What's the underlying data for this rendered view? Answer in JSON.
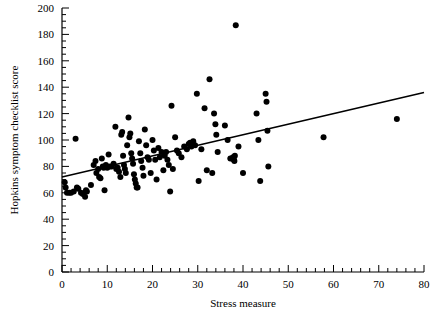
{
  "chart_data": {
    "type": "scatter",
    "title": "",
    "xlabel": "Stress measure",
    "ylabel": "Hopkins symptom checklist score",
    "xlim": [
      0,
      80
    ],
    "ylim": [
      0,
      200
    ],
    "xticks": [
      0,
      10,
      20,
      30,
      40,
      50,
      60,
      70,
      80
    ],
    "yticks": [
      0,
      20,
      40,
      60,
      80,
      100,
      120,
      140,
      160,
      180,
      200
    ],
    "xticklabels": [
      "0",
      "10",
      "20",
      "30",
      "40",
      "50",
      "60",
      "70",
      "80"
    ],
    "yticklabels": [
      "0",
      "20",
      "40",
      "60",
      "80",
      "100",
      "120",
      "140",
      "160",
      "180",
      "200"
    ],
    "x_minor_tick_step": 2,
    "y_minor_tick_step": 5,
    "grid": false,
    "legend": null,
    "marker": "filled-circle",
    "marker_color": "#000000",
    "marker_size_px": 4.2,
    "series": [
      {
        "name": "observations",
        "points": [
          [
            0.6,
            68
          ],
          [
            0.8,
            64
          ],
          [
            1.1,
            60
          ],
          [
            1.6,
            60
          ],
          [
            2.0,
            60
          ],
          [
            2.6,
            61
          ],
          [
            3.0,
            101
          ],
          [
            3.3,
            64
          ],
          [
            3.6,
            63
          ],
          [
            4.2,
            60
          ],
          [
            4.6,
            59
          ],
          [
            5.1,
            57
          ],
          [
            5.3,
            62
          ],
          [
            5.5,
            61
          ],
          [
            6.4,
            66
          ],
          [
            7.0,
            81
          ],
          [
            7.4,
            84
          ],
          [
            7.6,
            75
          ],
          [
            8.0,
            78
          ],
          [
            8.2,
            72
          ],
          [
            8.5,
            71
          ],
          [
            8.8,
            86
          ],
          [
            9.0,
            80
          ],
          [
            9.2,
            79
          ],
          [
            9.4,
            62
          ],
          [
            9.7,
            81
          ],
          [
            10.0,
            79
          ],
          [
            10.3,
            89
          ],
          [
            10.6,
            80
          ],
          [
            11.0,
            80
          ],
          [
            11.4,
            82
          ],
          [
            11.8,
            110
          ],
          [
            12.0,
            78
          ],
          [
            12.3,
            79
          ],
          [
            12.6,
            76
          ],
          [
            12.9,
            72
          ],
          [
            13.1,
            104
          ],
          [
            13.3,
            106
          ],
          [
            13.5,
            88
          ],
          [
            13.7,
            81
          ],
          [
            13.9,
            78
          ],
          [
            14.1,
            75
          ],
          [
            14.4,
            96
          ],
          [
            14.7,
            117
          ],
          [
            14.9,
            102
          ],
          [
            15.1,
            105
          ],
          [
            15.3,
            90
          ],
          [
            15.5,
            86
          ],
          [
            15.7,
            82
          ],
          [
            15.9,
            74
          ],
          [
            16.1,
            70
          ],
          [
            16.3,
            67
          ],
          [
            16.5,
            64
          ],
          [
            16.7,
            64
          ],
          [
            17.0,
            99
          ],
          [
            17.3,
            90
          ],
          [
            17.5,
            84
          ],
          [
            17.8,
            79
          ],
          [
            18.0,
            73
          ],
          [
            18.3,
            108
          ],
          [
            18.6,
            96
          ],
          [
            18.9,
            87
          ],
          [
            19.2,
            85
          ],
          [
            19.6,
            75
          ],
          [
            20.0,
            100
          ],
          [
            20.3,
            92
          ],
          [
            20.6,
            85
          ],
          [
            20.9,
            70
          ],
          [
            21.3,
            94
          ],
          [
            21.6,
            87
          ],
          [
            22.0,
            91
          ],
          [
            22.4,
            77
          ],
          [
            22.7,
            88
          ],
          [
            23.0,
            91
          ],
          [
            23.3,
            85
          ],
          [
            23.6,
            81
          ],
          [
            23.9,
            61
          ],
          [
            24.2,
            126
          ],
          [
            24.5,
            78
          ],
          [
            25.0,
            102
          ],
          [
            25.4,
            92
          ],
          [
            25.8,
            90
          ],
          [
            26.4,
            87
          ],
          [
            27.0,
            95
          ],
          [
            27.6,
            93
          ],
          [
            28.0,
            97
          ],
          [
            28.3,
            98
          ],
          [
            28.6,
            95
          ],
          [
            29.0,
            99
          ],
          [
            29.4,
            96
          ],
          [
            29.8,
            135
          ],
          [
            30.2,
            69
          ],
          [
            30.8,
            93
          ],
          [
            31.5,
            124
          ],
          [
            32.0,
            77
          ],
          [
            32.6,
            146
          ],
          [
            33.2,
            75
          ],
          [
            33.6,
            120
          ],
          [
            33.9,
            112
          ],
          [
            34.1,
            104
          ],
          [
            34.4,
            91
          ],
          [
            36.0,
            111
          ],
          [
            36.6,
            100
          ],
          [
            37.2,
            86
          ],
          [
            37.6,
            86
          ],
          [
            37.8,
            87
          ],
          [
            38.0,
            85
          ],
          [
            38.1,
            84
          ],
          [
            38.2,
            88
          ],
          [
            38.4,
            187
          ],
          [
            39.0,
            95
          ],
          [
            40.0,
            75
          ],
          [
            43.0,
            120
          ],
          [
            43.4,
            100
          ],
          [
            43.8,
            69
          ],
          [
            45.0,
            135
          ],
          [
            45.2,
            129
          ],
          [
            45.4,
            107
          ],
          [
            45.6,
            80
          ],
          [
            57.8,
            102
          ],
          [
            74.0,
            116
          ]
        ]
      }
    ],
    "trendline": {
      "name": "least-squares fit",
      "x_start": 0,
      "y_start": 72,
      "x_end": 80,
      "y_end": 136,
      "color": "#000000",
      "width_px": 1.6
    }
  },
  "axes": {
    "axis_color": "#000000",
    "spines": [
      "left",
      "bottom"
    ],
    "tick_direction": "in"
  }
}
